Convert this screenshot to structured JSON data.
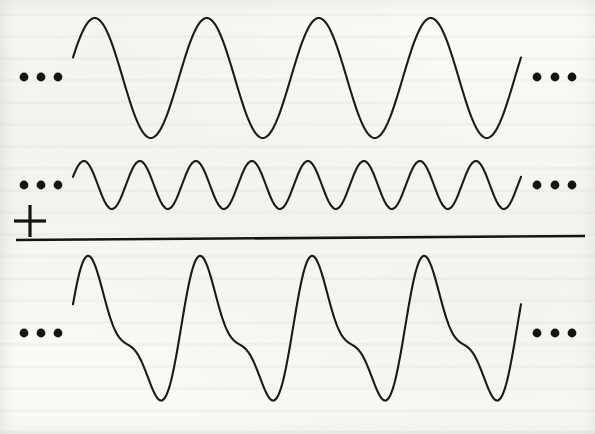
{
  "figure": {
    "title": "Superposition of a sine wave and its second harmonic",
    "background_color": "#fbfaf7",
    "ink_color": "#1a1a1a",
    "width": 595,
    "height": 434,
    "operator_symbol": "+",
    "operator_name": "plus-sign",
    "ellipsis_glyph": "• • •",
    "divider_label": "sum-rule-line"
  },
  "rows": [
    {
      "id": "wave-top",
      "role": "first-addend",
      "label": "Fundamental wave",
      "leading_ellipsis": "• • •",
      "trailing_ellipsis": "• • •"
    },
    {
      "id": "wave-middle",
      "role": "second-addend",
      "label": "Second harmonic wave",
      "leading_ellipsis": "• • •",
      "trailing_ellipsis": "• • •"
    },
    {
      "id": "wave-bottom",
      "role": "sum",
      "label": "Resultant summed wave",
      "leading_ellipsis": "• • •",
      "trailing_ellipsis": "• • •"
    }
  ],
  "chart_data": {
    "type": "line",
    "title": "Superposition of a sine wave and its second harmonic",
    "xlabel": "",
    "ylabel": "",
    "grid": false,
    "legend": "none",
    "x_domain": [
      73,
      521
    ],
    "samples": 360,
    "series": [
      {
        "name": "Fundamental wave",
        "row": "wave-top",
        "baseline_y": 78,
        "amplitude": 60,
        "cycles": 4,
        "period_px": 112,
        "phase_deg": 20,
        "peaks_x": [
          99,
          212,
          323,
          437
        ],
        "peak_y": 18,
        "troughs_x": [
          157,
          267,
          378,
          490
        ],
        "trough_y": 138,
        "start_point": [
          73,
          78
        ],
        "end_point": [
          521,
          94
        ]
      },
      {
        "name": "Second harmonic wave",
        "row": "wave-middle",
        "baseline_y": 185,
        "amplitude": 24,
        "cycles": 8,
        "period_px": 56,
        "phase_deg": 20,
        "peaks_x": [
          87,
          143,
          198,
          255,
          310,
          367,
          423,
          478
        ],
        "peak_y": 161,
        "troughs_x": [
          115,
          170,
          227,
          282,
          338,
          395,
          450,
          505
        ],
        "trough_y": 209,
        "start_point": [
          73,
          185
        ],
        "end_point": [
          521,
          193
        ]
      },
      {
        "name": "Resultant summed wave",
        "row": "wave-bottom",
        "baseline_y": 333,
        "amplitude": 84,
        "cycles": 4,
        "period_px": 112,
        "phase_deg": 20,
        "peaks_x": [
          92,
          203,
          315,
          428
        ],
        "peak_y": 258,
        "troughs_x": [
          167,
          275,
          388,
          500
        ],
        "trough_y": 410,
        "shoulders_x": [
          130,
          242,
          353,
          465
        ],
        "shoulder_y": 330,
        "start_point": [
          73,
          333
        ],
        "end_point": [
          521,
          333
        ]
      }
    ]
  },
  "marks": {
    "left_dots_x": [
      24,
      41,
      58
    ],
    "right_dots_x": [
      537,
      555,
      572
    ],
    "dot_radius": 4.4,
    "top_dots_y": 77,
    "middle_dots_y": 185,
    "bottom_dots_y": 333,
    "plus": {
      "cx": 30,
      "cy": 221,
      "arm": 16
    },
    "rule": {
      "x1": 16,
      "y1": 240,
      "x2": 585,
      "y2": 236
    }
  }
}
